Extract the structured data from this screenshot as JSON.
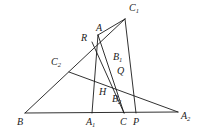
{
  "figure": {
    "kind": "geometry-diagram",
    "width": 202,
    "height": 134,
    "background_color": "#ffffff",
    "stroke_color": "#1a1a1a",
    "label_color": "#1a1a1a",
    "points": {
      "B": {
        "label": "B",
        "sub": "",
        "x": 25,
        "y": 113,
        "label_x": 17,
        "label_y": 117
      },
      "A1": {
        "label": "A",
        "sub": "1",
        "x": 92,
        "y": 113,
        "label_x": 86,
        "label_y": 117
      },
      "C": {
        "label": "C",
        "sub": "",
        "x": 124,
        "y": 113,
        "label_x": 120,
        "label_y": 117
      },
      "P": {
        "label": "P",
        "sub": "",
        "x": 136,
        "y": 113,
        "label_x": 133,
        "label_y": 117
      },
      "A2": {
        "label": "A",
        "sub": "2",
        "x": 178,
        "y": 112,
        "label_x": 181,
        "label_y": 111
      },
      "C2": {
        "label": "C",
        "sub": "2",
        "x": 69,
        "y": 72,
        "label_x": 51,
        "label_y": 57
      },
      "C1": {
        "label": "C",
        "sub": "1",
        "x": 125,
        "y": 19,
        "label_x": 129,
        "label_y": 3
      },
      "A": {
        "label": "A",
        "sub": "",
        "x": 98,
        "y": 35,
        "label_x": 96,
        "label_y": 23
      },
      "R": {
        "label": "R",
        "sub": "",
        "x": 92,
        "y": 42,
        "label_x": 81,
        "label_y": 33
      },
      "B1": {
        "label": "B",
        "sub": "1",
        "x": 111,
        "y": 63,
        "label_x": 113,
        "label_y": 52
      },
      "Q": {
        "label": "Q",
        "sub": "",
        "x": 114,
        "y": 76,
        "label_x": 117,
        "label_y": 66
      },
      "H": {
        "label": "H",
        "sub": "",
        "x": 103,
        "y": 89,
        "label_x": 99,
        "label_y": 87
      },
      "B2": {
        "label": "B",
        "sub": "2",
        "x": 114,
        "y": 94,
        "label_x": 112,
        "label_y": 94
      }
    },
    "segments": [
      {
        "name": "base-line-B-A2",
        "from": "B",
        "to": "A2"
      },
      {
        "name": "side-B-C1",
        "from": "B",
        "to": "C1"
      },
      {
        "name": "cevian-C2-A2",
        "from": "C2",
        "to": "A2"
      },
      {
        "name": "side-A-C1",
        "from": "A",
        "to": "C1"
      },
      {
        "name": "segment-A-A1",
        "from": "A",
        "to": "A1"
      },
      {
        "name": "segment-A-C",
        "from": "A",
        "to": "C"
      },
      {
        "name": "segment-C1-P",
        "from": "C1",
        "to": "P"
      },
      {
        "name": "segment-R-C",
        "from": "R",
        "to": "C"
      }
    ]
  }
}
